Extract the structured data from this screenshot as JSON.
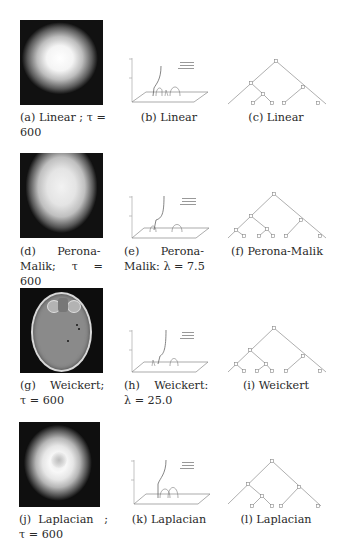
{
  "figure": {
    "rows": [
      {
        "image": {
          "label": "(a)",
          "caption_line1": "(a) Linear ; τ =",
          "caption_line2": "600",
          "method": "Linear",
          "tau": "600"
        },
        "plot": {
          "label": "(b)",
          "caption_line1": "(b) Linear",
          "caption_line2": ""
        },
        "tree": {
          "label": "(c)",
          "caption_line1": "(c) Linear"
        }
      },
      {
        "image": {
          "label": "(d)",
          "caption_line1": "(d)      Perona-",
          "caption_line2": "Malik; τ = 600",
          "method": "Perona-Malik",
          "tau": "600"
        },
        "plot": {
          "label": "(e)",
          "caption_line1": "(e)      Perona-",
          "caption_line2": "Malik: λ = 7.5",
          "lambda": "7.5"
        },
        "tree": {
          "label": "(f)",
          "caption_line1": "(f) Perona-Malik"
        }
      },
      {
        "image": {
          "label": "(g)",
          "caption_line1": "(g)    Weickert;",
          "caption_line2": "τ = 600",
          "method": "Weickert",
          "tau": "600"
        },
        "plot": {
          "label": "(h)",
          "caption_line1": "(h)    Weickert:",
          "caption_line2": "λ = 25.0",
          "lambda": "25.0"
        },
        "tree": {
          "label": "(i)",
          "caption_line1": "(i) Weickert"
        }
      },
      {
        "image": {
          "label": "(j)",
          "caption_line1": "(j)  Laplacian   ;",
          "caption_line2": "τ = 600",
          "method": "Laplacian",
          "tau": "600"
        },
        "plot": {
          "label": "(k)",
          "caption_line1": "(k) Laplacian",
          "caption_line2": ""
        },
        "tree": {
          "label": "(l)",
          "caption_line1": "(l) Laplacian"
        }
      }
    ],
    "plot_legend": [
      "Trace tail",
      "Tube tail",
      "lambda tail"
    ],
    "colors": {
      "background": "#ffffff",
      "text": "#2a2a2a",
      "line": "#9a9a9a",
      "image_bg": "#0d0d0d"
    }
  }
}
